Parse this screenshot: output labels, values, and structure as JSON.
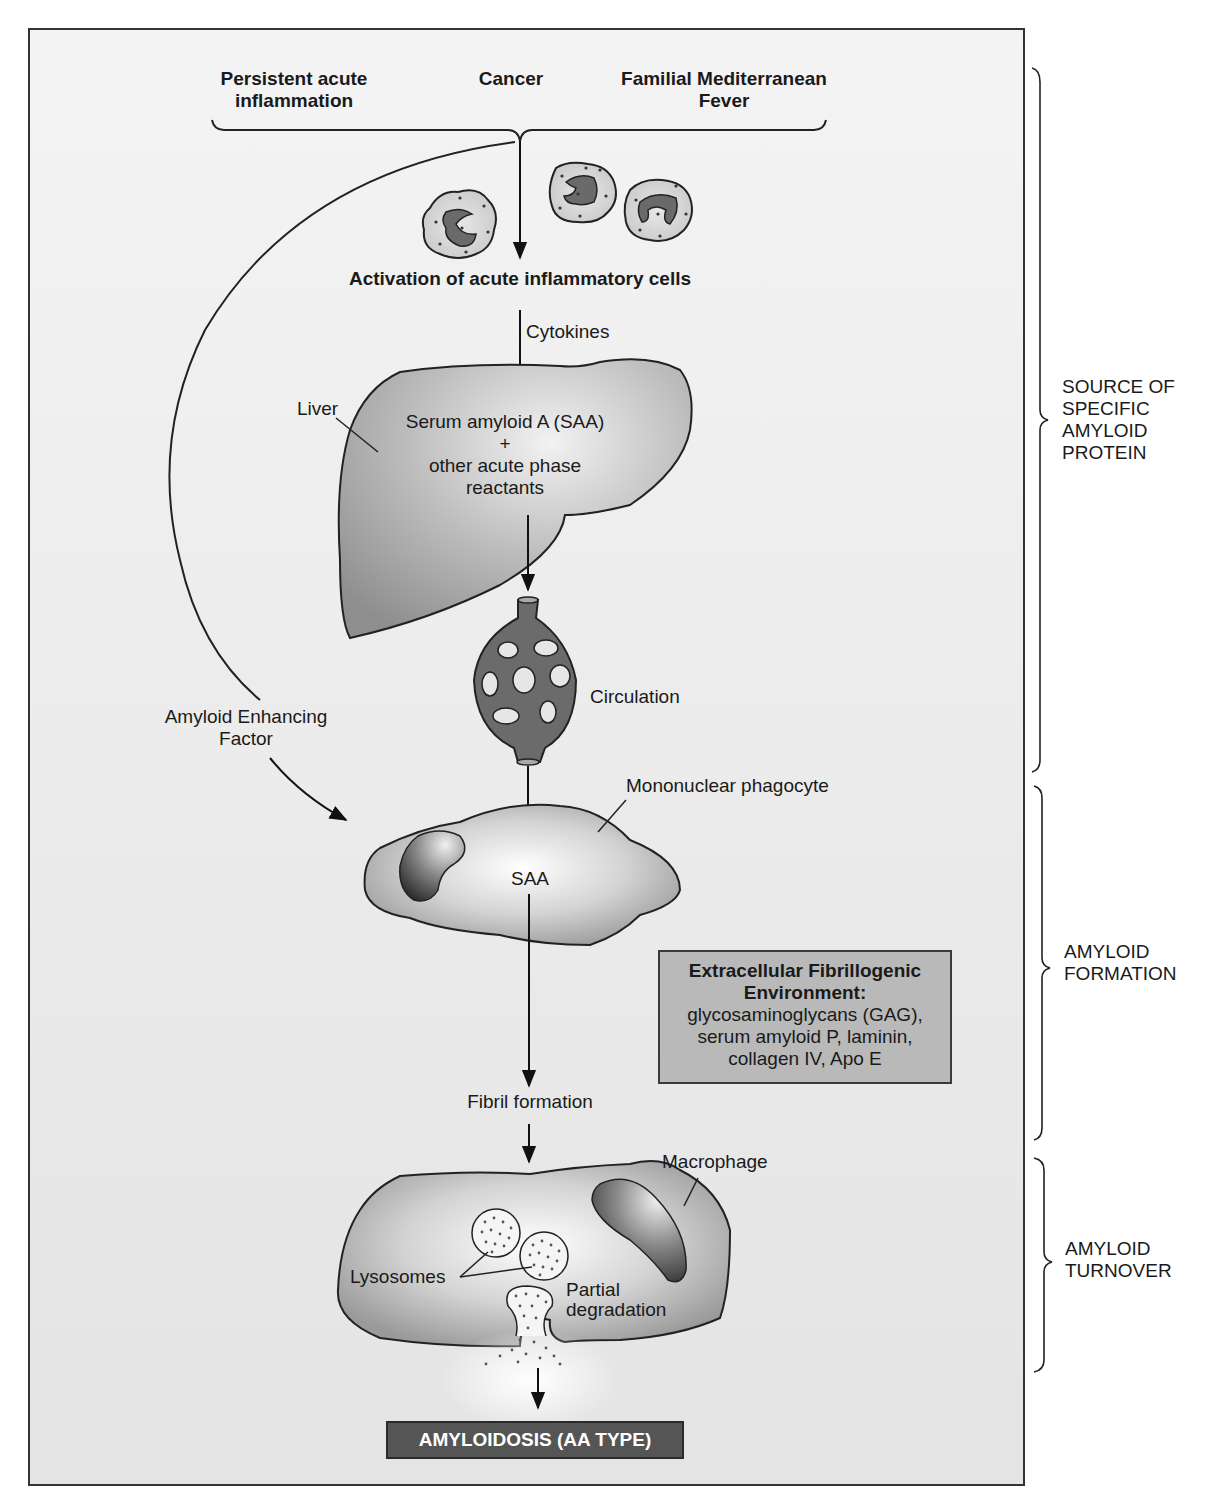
{
  "causes": {
    "persistent": [
      "Persistent acute",
      "inflammation"
    ],
    "cancer": "Cancer",
    "fmf": [
      "Familial Mediterranean",
      "Fever"
    ]
  },
  "activation_label": "Activation of acute inflammatory cells",
  "cytokines_label": "Cytokines",
  "liver": {
    "label": "Liver",
    "content": [
      "Serum amyloid A (SAA)",
      "+",
      "other acute phase",
      "reactants"
    ]
  },
  "circulation_label": "Circulation",
  "amyloid_enhancing_factor": [
    "Amyloid Enhancing",
    "Factor"
  ],
  "mononuclear_phagocyte": {
    "label": "Mononuclear phagocyte",
    "content": "SAA"
  },
  "environment_box": {
    "title": [
      "Extracellular Fibrillogenic",
      "Environment:"
    ],
    "items": [
      "glycosaminoglycans (GAG),",
      "serum amyloid P, laminin,",
      "collagen IV, Apo E"
    ],
    "fill_color": "#b9b9b9"
  },
  "fibril_formation_label": "Fibril formation",
  "macrophage": {
    "label": "Macrophage",
    "lysosomes_label": "Lysosomes",
    "degradation_label": [
      "Partial",
      "degradation"
    ]
  },
  "final_outcome": {
    "label": "AMYLOIDOSIS (AA TYPE)",
    "fill_color": "#555555"
  },
  "stages": [
    {
      "label": [
        "SOURCE OF",
        "SPECIFIC",
        "AMYLOID",
        "PROTEIN"
      ]
    },
    {
      "label": [
        "AMYLOID",
        "FORMATION"
      ]
    },
    {
      "label": [
        "AMYLOID",
        "TURNOVER"
      ]
    }
  ]
}
